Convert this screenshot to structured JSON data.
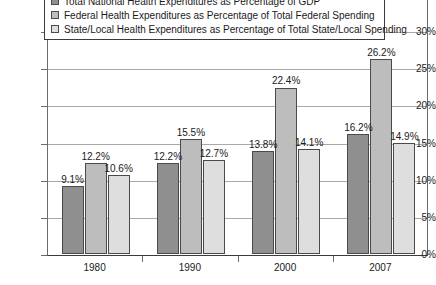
{
  "chart_data": {
    "type": "bar",
    "title": "",
    "subtitle": "",
    "xlabel": "",
    "ylabel": "",
    "categories": [
      "1980",
      "1990",
      "2000",
      "2007"
    ],
    "series": [
      {
        "name": "Total National Health Expenditures as Percentage of GDP",
        "swatch": "s0",
        "color": "#8f8f8f",
        "values": [
          9.1,
          12.2,
          13.8,
          16.2
        ],
        "labels": [
          "9.1%",
          "12.2%",
          "13.8%",
          "16.2%"
        ]
      },
      {
        "name": "Federal Health Expenditures as Percentage of Total Federal Spending",
        "swatch": "s1",
        "color": "#bdbdbd",
        "values": [
          12.2,
          15.5,
          22.4,
          26.2
        ],
        "labels": [
          "12.2%",
          "15.5%",
          "22.4%",
          "26.2%"
        ]
      },
      {
        "name": "State/Local Health Expenditures as Percentage of Total State/Local Spending",
        "swatch": "s2",
        "color": "#dedede",
        "values": [
          10.6,
          12.7,
          14.1,
          14.9
        ],
        "labels": [
          "10.6%",
          "12.7%",
          "14.1%",
          "14.9%"
        ]
      }
    ],
    "ylim": [
      0,
      30
    ],
    "ytick_step": 5,
    "ytick_labels": [
      "0%",
      "5%",
      "10%",
      "15%",
      "20%",
      "25%",
      "30%"
    ],
    "ytick_values": [
      0,
      5,
      10,
      15,
      20,
      25,
      30
    ],
    "grid": true,
    "legend_position": "top"
  }
}
